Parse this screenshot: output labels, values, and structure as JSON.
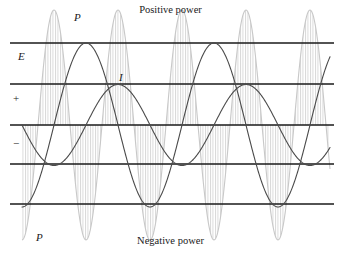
{
  "figure": {
    "title_top": "Positive power",
    "title_bottom": "Negative power",
    "labels": {
      "p_top": "P",
      "p_bottom": "P",
      "e": "E",
      "i": "I",
      "plus": "+",
      "minus": "−"
    },
    "colors": {
      "background": "#ffffff",
      "axis_line": "#1a1a1a",
      "wave_e": "#4a4a4a",
      "wave_i": "#4a4a4a",
      "wave_p": "#c8c8c8",
      "hatch": "#c8c8c8",
      "text": "#1a1a1a"
    }
  },
  "chart_data": {
    "type": "line",
    "xlabel": "",
    "ylabel": "",
    "grid": true,
    "legend_position": "inline-annotations",
    "axis": {
      "x_range_px": [
        22,
        330
      ],
      "y_range_px": [
        43,
        204
      ],
      "center_line_y_px": 125,
      "gridline_y_px": [
        43,
        84,
        125,
        164,
        204
      ],
      "gridline_count": 5,
      "gridline_spacing_px": 40.25
    },
    "annotations": [
      {
        "text": "Positive power",
        "x_px": 170,
        "y_px": 10
      },
      {
        "text": "Negative power",
        "x_px": 170,
        "y_px": 241
      },
      {
        "text": "P",
        "x_px": 78,
        "y_px": 18
      },
      {
        "text": "P",
        "x_px": 40,
        "y_px": 238
      },
      {
        "text": "E",
        "x_px": 22,
        "y_px": 57
      },
      {
        "text": "I",
        "x_px": 122,
        "y_px": 78
      },
      {
        "text": "+",
        "x_px": 16,
        "y_px": 99
      },
      {
        "text": "−",
        "x_px": 16,
        "y_px": 144
      }
    ],
    "series": [
      {
        "name": "E",
        "label": "E",
        "color": "#4a4a4a",
        "waveform": "sine",
        "amplitude_px": 82,
        "period_px": 128,
        "phase_deg": 270,
        "baseline_y_px": 125,
        "peak_y_px": 43,
        "trough_y_px": 204,
        "cycles_visible": 2.4,
        "linewidth_px": 1.1
      },
      {
        "name": "I",
        "label": "I",
        "color": "#4a4a4a",
        "waveform": "sine",
        "amplitude_px": 40.5,
        "period_px": 128,
        "phase_deg": 180,
        "baseline_y_px": 125,
        "peak_y_px": 84,
        "trough_y_px": 164,
        "cycles_visible": 2.4,
        "linewidth_px": 1.1
      },
      {
        "name": "P",
        "label": "P",
        "color": "#c8c8c8",
        "waveform": "sine",
        "amplitude_px": 115,
        "period_px": 64,
        "phase_deg": 270,
        "baseline_y_px": 125,
        "peak_y_px": 10,
        "trough_y_px": 240,
        "cycles_visible": 4.8,
        "linewidth_px": 1.1,
        "fill": "vertical-hatch",
        "hatch_spacing_px": 2.5
      }
    ]
  }
}
